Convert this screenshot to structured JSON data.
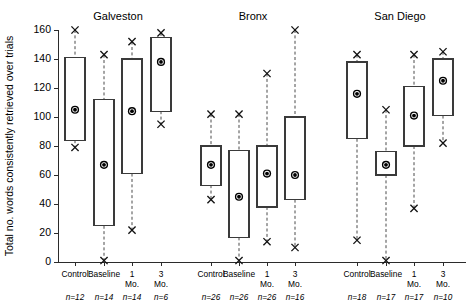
{
  "chart_data": {
    "type": "box",
    "title": "",
    "xlabel": "",
    "ylabel": "Total no. words consistently retrieved over trials",
    "ylim": [
      0,
      160
    ],
    "yticks": [
      0,
      20,
      40,
      60,
      80,
      100,
      120,
      140,
      160
    ],
    "ytick_labels": [
      "0",
      "20",
      "40",
      "60",
      "80",
      "100",
      "120",
      "140",
      "160"
    ],
    "grid": false,
    "legend": "none",
    "group_titles": [
      "Galveston",
      "Bronx",
      "San Diego"
    ],
    "categories": [
      "Control",
      "Baseline",
      "1 Mo.",
      "3 Mo.",
      "Control",
      "Baseline",
      "1 Mo.",
      "3 Mo.",
      "Control",
      "Baseline",
      "1 Mo.",
      "3 Mo."
    ],
    "sample_sizes": [
      "n=12",
      "n=14",
      "n=14",
      "n=6",
      "n=26",
      "n=26",
      "n=26",
      "n=16",
      "n=18",
      "n=17",
      "n=17",
      "n=10"
    ],
    "boxes": [
      {
        "group": "Galveston",
        "category": "Control",
        "whisker_low": 79,
        "q1": 84,
        "mean": 105,
        "q3": 141,
        "whisker_high": 160,
        "n": "n=12"
      },
      {
        "group": "Galveston",
        "category": "Baseline",
        "whisker_low": 1,
        "q1": 25,
        "mean": 67,
        "q3": 112,
        "whisker_high": 143,
        "n": "n=14"
      },
      {
        "group": "Galveston",
        "category": "1 Mo.",
        "whisker_low": 22,
        "q1": 61,
        "mean": 104,
        "q3": 140,
        "whisker_high": 152,
        "n": "n=14"
      },
      {
        "group": "Galveston",
        "category": "3 Mo.",
        "whisker_low": 95,
        "q1": 104,
        "mean": 138,
        "q3": 155,
        "whisker_high": 158,
        "n": "n=6"
      },
      {
        "group": "Bronx",
        "category": "Control",
        "whisker_low": 43,
        "q1": 53,
        "mean": 67,
        "q3": 80,
        "whisker_high": 102,
        "n": "n=26"
      },
      {
        "group": "Bronx",
        "category": "Baseline",
        "whisker_low": 1,
        "q1": 17,
        "mean": 45,
        "q3": 77,
        "whisker_high": 102,
        "n": "n=26"
      },
      {
        "group": "Bronx",
        "category": "1 Mo.",
        "whisker_low": 14,
        "q1": 38,
        "mean": 61,
        "q3": 80,
        "whisker_high": 130,
        "n": "n=26"
      },
      {
        "group": "Bronx",
        "category": "3 Mo.",
        "whisker_low": 10,
        "q1": 43,
        "mean": 60,
        "q3": 100,
        "whisker_high": 160,
        "n": "n=16"
      },
      {
        "group": "San Diego",
        "category": "Control",
        "whisker_low": 15,
        "q1": 85,
        "mean": 116,
        "q3": 138,
        "whisker_high": 143,
        "n": "n=18"
      },
      {
        "group": "San Diego",
        "category": "Baseline",
        "whisker_low": 1,
        "q1": 60,
        "mean": 67,
        "q3": 76,
        "whisker_high": 105,
        "n": "n=17"
      },
      {
        "group": "San Diego",
        "category": "1 Mo.",
        "whisker_low": 37,
        "q1": 80,
        "mean": 101,
        "q3": 121,
        "whisker_high": 143,
        "n": "n=17"
      },
      {
        "group": "San Diego",
        "category": "3 Mo.",
        "whisker_low": 82,
        "q1": 101,
        "mean": 125,
        "q3": 140,
        "whisker_high": 145,
        "n": "n=10"
      }
    ],
    "marker_legend": {
      "mean_marker": "filled-circle-with-ring",
      "extreme_marker": "x-cross"
    },
    "colors": {
      "axis": "#2b2b2b",
      "box_stroke": "#3a3a3a",
      "whisker": "#4a4a4a",
      "marker": "#000000",
      "background": "#ffffff"
    }
  }
}
